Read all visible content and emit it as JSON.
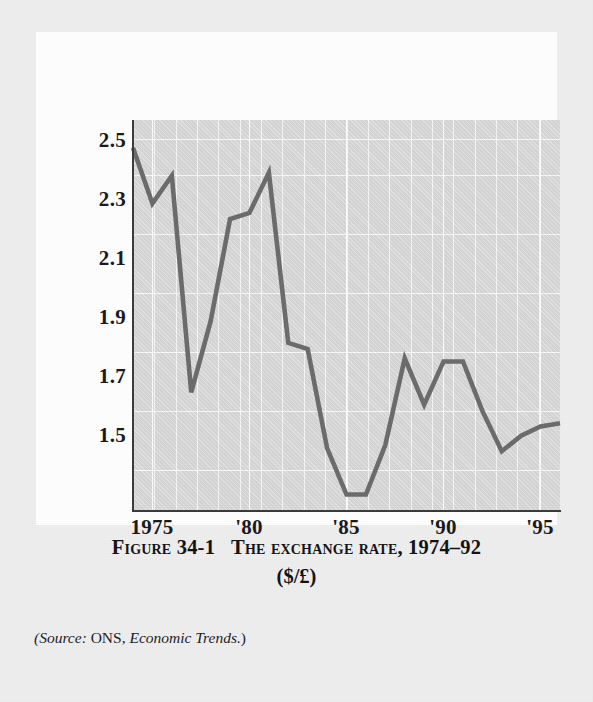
{
  "figure": {
    "number_label": "Figure 34-1",
    "title": "The exchange rate, 1974–92",
    "subtitle": "($/£)",
    "source_prefix": "(Source:",
    "source_org": "ONS,",
    "source_publication": "Economic Trends.",
    "source_suffix": ")"
  },
  "colors": {
    "line": "#6b6b6b",
    "panel": "#d9d9d9",
    "axis": "#3a3a3a",
    "grid": "#ffffff",
    "page": "#e9e9e9",
    "card": "#ffffff",
    "text": "#17171c"
  },
  "chart_data": {
    "type": "line",
    "title": "The exchange rate, 1974–92 ($/£)",
    "xlabel": "",
    "ylabel": "",
    "xlim": [
      1974,
      1996
    ],
    "ylim": [
      1.32,
      2.58
    ],
    "ytick_values": [
      2.5,
      2.3,
      2.1,
      1.9,
      1.7,
      1.5
    ],
    "ytick_labels": [
      "2.5",
      "2.3",
      "2.1",
      "1.9",
      "1.7",
      "1.5"
    ],
    "xtick_values": [
      1975,
      1980,
      1985,
      1990,
      1995
    ],
    "xtick_labels": [
      "1975",
      "'80",
      "'85",
      "'90",
      "'95"
    ],
    "grid": true,
    "legend": "none",
    "series": [
      {
        "name": "$/£ exchange rate",
        "x": [
          1974,
          1975,
          1976,
          1977,
          1978,
          1979,
          1980,
          1981,
          1982,
          1983,
          1984,
          1985,
          1986,
          1987,
          1988,
          1989,
          1990,
          1991,
          1992,
          1993,
          1994,
          1995,
          1996
        ],
        "values": [
          2.49,
          2.31,
          2.4,
          1.7,
          1.93,
          2.26,
          2.28,
          2.41,
          1.86,
          1.84,
          1.52,
          1.37,
          1.37,
          1.53,
          1.81,
          1.66,
          1.8,
          1.8,
          1.64,
          1.51,
          1.56,
          1.59,
          1.6
        ]
      }
    ]
  }
}
